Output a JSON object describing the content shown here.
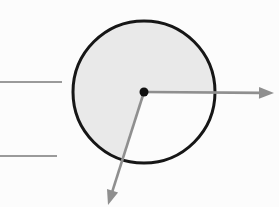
{
  "figure": {
    "canvas": {
      "width": 279,
      "height": 207,
      "background_color": "#fcfcfc"
    },
    "disk": {
      "cx": 144,
      "cy": 92,
      "r": 71,
      "fill": "#e9e9e9",
      "stroke": "#161616",
      "stroke_width": 3
    },
    "unshaded_sector": {
      "start_angle_deg": 0,
      "end_angle_deg": 108,
      "fill": "#fcfcfc"
    },
    "center_dot": {
      "cx": 144,
      "cy": 92,
      "r": 4.5,
      "color": "#111111"
    },
    "arrows": [
      {
        "name": "right-arrow",
        "x1": 144,
        "y1": 92,
        "x2": 274,
        "y2": 93,
        "color": "#8f8f8f",
        "stroke_width": 2.6,
        "head_length": 15,
        "head_half_width": 5.8
      },
      {
        "name": "down-left-arrow",
        "x1": 144,
        "y1": 92,
        "x2": 108,
        "y2": 205,
        "color": "#8f8f8f",
        "stroke_width": 2.6,
        "head_length": 15,
        "head_half_width": 5.8
      }
    ],
    "label_lines": [
      {
        "name": "label-line-top",
        "x1": 0,
        "y1": 82,
        "x2": 62,
        "y2": 82,
        "color": "#9a9a9a",
        "stroke_width": 2
      },
      {
        "name": "label-line-bottom",
        "x1": 0,
        "y1": 156,
        "x2": 57,
        "y2": 156,
        "color": "#9a9a9a",
        "stroke_width": 2
      }
    ]
  }
}
